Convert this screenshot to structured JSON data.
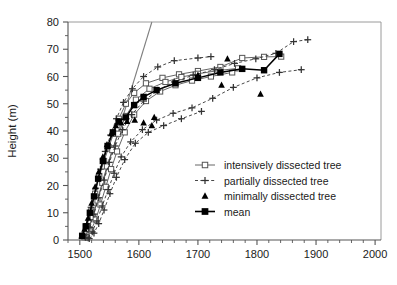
{
  "chart_data": {
    "type": "scatter",
    "title": "",
    "xlabel": "",
    "ylabel": "Height (m)",
    "xlim": [
      1480,
      2010
    ],
    "ylim": [
      0,
      80
    ],
    "xticks": [
      1500,
      1600,
      1700,
      1800,
      1900,
      2000
    ],
    "xtick_labels": [
      "1500",
      "1600",
      "1700",
      "1800",
      "1900",
      "2000"
    ],
    "yticks": [
      0,
      10,
      20,
      30,
      40,
      50,
      60,
      70,
      80
    ],
    "ytick_labels": [
      "0",
      "10",
      "20",
      "30",
      "40",
      "50",
      "60",
      "70",
      "80"
    ],
    "x_minor_step": 20,
    "y_minor_step": 5,
    "grid": false,
    "legend_position": "center-right",
    "legend": [
      {
        "key": "intensive",
        "label": "intensively dissected tree",
        "marker": "open-square",
        "line": "solid"
      },
      {
        "key": "partial",
        "label": "partially dissected tree",
        "marker": "plus",
        "line": "dashed"
      },
      {
        "key": "minimal",
        "label": "minimally dissected tree",
        "marker": "filled-triangle",
        "line": "none"
      },
      {
        "key": "mean",
        "label": "mean",
        "marker": "filled-square",
        "line": "solid"
      }
    ],
    "colors": {
      "intensive": "#555555",
      "partial": "#333333",
      "minimal": "#000000",
      "mean": "#000000",
      "reference_line": "#808080",
      "axis": "#555555",
      "text": "#1a1a1a"
    },
    "reference_line": {
      "name": "steep-linear-reference",
      "x": [
        1509,
        1622
      ],
      "y": [
        0,
        80
      ]
    },
    "series": [
      {
        "name": "intensively dissected tree",
        "key": "intensive",
        "marker": "open-square",
        "line": "solid",
        "trees": [
          {
            "x": [
              1504,
              1512,
              1519,
              1526,
              1533,
              1541,
              1549,
              1557,
              1566,
              1578,
              1592,
              1612,
              1640,
              1668,
              1700,
              1738,
              1775,
              1812,
              1841
            ],
            "y": [
              1.5,
              5.0,
              10.5,
              17.0,
              23.5,
              29.0,
              34.0,
              39.0,
              44.5,
              50.0,
              54.0,
              57.5,
              59.5,
              60.8,
              62.0,
              63.5,
              66.8,
              67.2,
              67.3
            ]
          },
          {
            "x": [
              1508,
              1515,
              1522,
              1530,
              1538,
              1546,
              1555,
              1565,
              1578,
              1595,
              1618,
              1645,
              1672,
              1700,
              1735,
              1768
            ],
            "y": [
              1.0,
              4.0,
              8.5,
              14.5,
              21.0,
              27.0,
              33.0,
              39.0,
              45.5,
              51.5,
              55.5,
              58.0,
              59.8,
              61.0,
              62.2,
              63.0
            ]
          },
          {
            "x": [
              1512,
              1519,
              1527,
              1535,
              1544,
              1553,
              1563,
              1576,
              1592,
              1612,
              1636,
              1662,
              1690,
              1722,
              1758
            ],
            "y": [
              1.0,
              3.5,
              7.5,
              13.0,
              19.5,
              26.0,
              32.5,
              39.5,
              46.0,
              51.0,
              54.5,
              56.8,
              58.5,
              60.0,
              61.5
            ]
          }
        ]
      },
      {
        "name": "partially dissected tree",
        "key": "partial",
        "marker": "plus",
        "line": "dashed",
        "trees": [
          {
            "x": [
              1505,
              1512,
              1519,
              1527,
              1535,
              1543,
              1552,
              1562,
              1574,
              1589,
              1608,
              1632,
              1660,
              1700,
              1722
            ],
            "y": [
              2.0,
              6.0,
              12.0,
              19.0,
              26.0,
              32.5,
              38.5,
              44.5,
              50.5,
              55.5,
              60.0,
              63.5,
              65.8,
              66.8,
              67.3
            ]
          },
          {
            "x": [
              1510,
              1517,
              1524,
              1532,
              1541,
              1550,
              1560,
              1572,
              1588,
              1608,
              1632,
              1660,
              1692,
              1728,
              1762,
              1798,
              1832,
              1862,
              1886
            ],
            "y": [
              1.0,
              4.5,
              9.5,
              15.5,
              22.0,
              28.5,
              34.5,
              40.5,
              46.0,
              51.0,
              55.0,
              58.0,
              60.5,
              62.5,
              64.8,
              66.5,
              68.5,
              72.8,
              73.5
            ]
          },
          {
            "x": [
              1514,
              1521,
              1529,
              1538,
              1548,
              1558,
              1570,
              1586,
              1606,
              1630,
              1658,
              1690,
              1725,
              1760,
              1800,
              1838,
              1875
            ],
            "y": [
              0.8,
              3.0,
              7.0,
              12.5,
              18.5,
              24.5,
              30.5,
              36.0,
              40.5,
              44.0,
              46.5,
              48.5,
              52.0,
              56.0,
              59.5,
              61.5,
              62.5
            ]
          },
          {
            "x": [
              1516,
              1524,
              1532,
              1541,
              1551,
              1562,
              1576,
              1594,
              1616,
              1642,
              1672,
              1706
            ],
            "y": [
              0.5,
              2.5,
              6.0,
              11.0,
              17.0,
              23.0,
              29.5,
              35.5,
              39.5,
              42.0,
              44.5,
              47.2
            ]
          }
        ]
      },
      {
        "name": "minimally dissected tree",
        "key": "minimal",
        "marker": "filled-triangle",
        "line": "none",
        "points": {
          "x": [
            1503,
            1508,
            1514,
            1520,
            1526,
            1532,
            1539,
            1546,
            1553,
            1561,
            1570,
            1580,
            1593,
            1608,
            1622,
            1626,
            1700,
            1740,
            1750,
            1806
          ],
          "y": [
            1.5,
            4.0,
            8.0,
            13.5,
            19.5,
            25.0,
            30.5,
            35.0,
            39.0,
            42.0,
            43.0,
            43.5,
            44.0,
            43.0,
            42.0,
            45.0,
            60.5,
            56.8,
            66.5,
            53.5
          ]
        }
      },
      {
        "name": "mean",
        "key": "mean",
        "marker": "filled-square",
        "line": "solid",
        "points": {
          "x": [
            1504,
            1510,
            1517,
            1524,
            1531,
            1539,
            1547,
            1556,
            1566,
            1578,
            1592,
            1608,
            1630,
            1662,
            1700,
            1738,
            1775,
            1812,
            1838
          ],
          "y": [
            1.5,
            5.0,
            10.0,
            16.0,
            22.5,
            29.0,
            34.5,
            39.5,
            43.5,
            45.0,
            49.5,
            52.5,
            55.0,
            57.5,
            59.5,
            61.5,
            62.8,
            62.3,
            68.3
          ]
        }
      }
    ]
  }
}
